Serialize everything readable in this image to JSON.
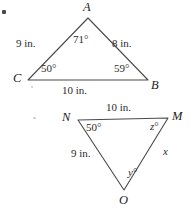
{
  "figure": {
    "stroke_color": "#4a4a4a",
    "text_color": "#2b2b2b",
    "background": "#ffffff",
    "triangles": [
      {
        "name": "triangle-ABC",
        "vertices": [
          {
            "label": "A",
            "x": 88,
            "y": 18
          },
          {
            "label": "B",
            "x": 148,
            "y": 80
          },
          {
            "label": "C",
            "x": 28,
            "y": 80
          }
        ],
        "vertex_labels": [
          {
            "name": "vertex-label-A",
            "text": "A",
            "x": 83,
            "y": 1
          },
          {
            "name": "vertex-label-B",
            "text": "B",
            "x": 151,
            "y": 79
          },
          {
            "name": "vertex-label-C",
            "text": "C",
            "x": 13,
            "y": 72
          }
        ],
        "angle_labels": [
          {
            "name": "angle-label-A",
            "text": "71",
            "unit": "°",
            "x": 73,
            "y": 34
          },
          {
            "name": "angle-label-B",
            "text": "59",
            "unit": "°",
            "x": 114,
            "y": 63
          },
          {
            "name": "angle-label-C",
            "text": "50",
            "unit": "°",
            "x": 41,
            "y": 63
          }
        ],
        "side_labels": [
          {
            "name": "side-label-CA",
            "text": "9 in.",
            "x": 16,
            "y": 38
          },
          {
            "name": "side-label-AB",
            "text": "8 in.",
            "x": 112,
            "y": 38
          },
          {
            "name": "side-label-CB",
            "text": "10 in.",
            "x": 62,
            "y": 85
          }
        ]
      },
      {
        "name": "triangle-NMO",
        "vertices": [
          {
            "label": "N",
            "x": 78,
            "y": 120
          },
          {
            "label": "M",
            "x": 168,
            "y": 118
          },
          {
            "label": "O",
            "x": 124,
            "y": 190
          }
        ],
        "vertex_labels": [
          {
            "name": "vertex-label-N",
            "text": "N",
            "x": 62,
            "y": 111
          },
          {
            "name": "vertex-label-M",
            "text": "M",
            "x": 172,
            "y": 110
          },
          {
            "name": "vertex-label-O",
            "text": "O",
            "x": 119,
            "y": 194
          }
        ],
        "angle_labels": [
          {
            "name": "angle-label-N",
            "text": "50",
            "unit": "°",
            "x": 86,
            "y": 122
          },
          {
            "name": "angle-label-M",
            "text": "z",
            "unit": "°",
            "x": 150,
            "y": 121,
            "unknown": true
          },
          {
            "name": "angle-label-O",
            "text": "y",
            "unit": "°",
            "x": 128,
            "y": 167,
            "unknown": true
          }
        ],
        "side_labels": [
          {
            "name": "side-label-NM",
            "text": "10 in.",
            "x": 106,
            "y": 102
          },
          {
            "name": "side-label-NO",
            "text": "9 in.",
            "x": 71,
            "y": 148
          },
          {
            "name": "side-label-MO",
            "text": "x",
            "x": 163,
            "y": 146,
            "unknown": true
          }
        ]
      }
    ]
  }
}
